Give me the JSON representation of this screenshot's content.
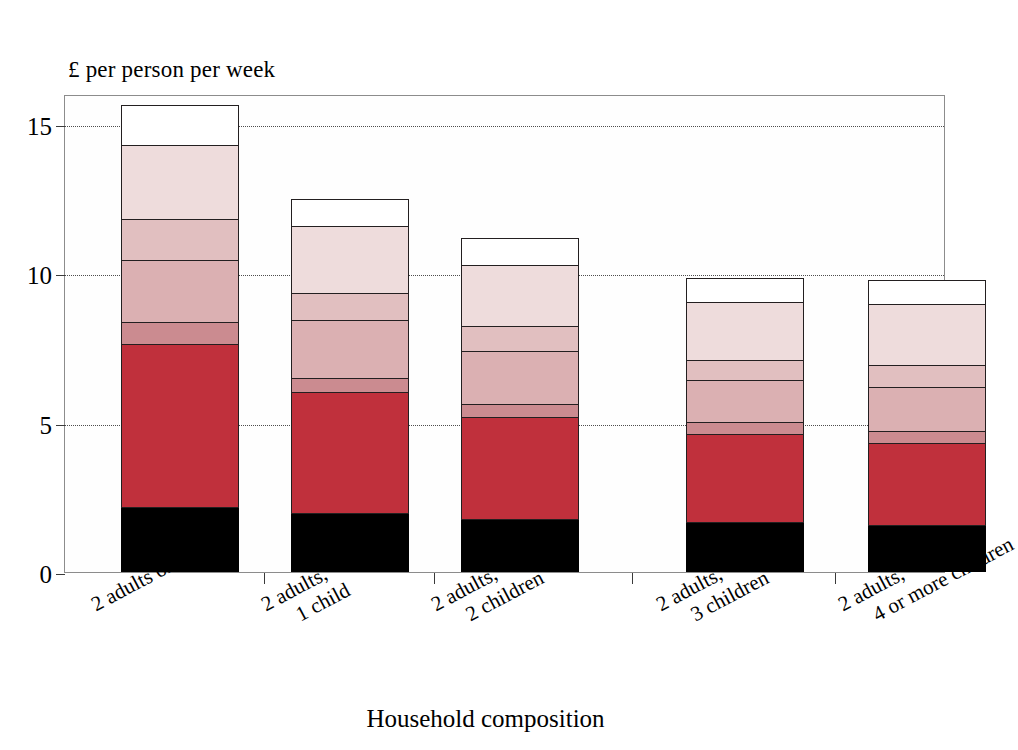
{
  "chart_data": {
    "type": "bar",
    "subtype": "stacked-bar",
    "title": "",
    "ylabel": "£ per person per week",
    "xlabel": "Household composition",
    "ylim": [
      0,
      16
    ],
    "yticks": [
      0,
      5,
      10,
      15
    ],
    "ytick_labels": [
      "0",
      "5",
      "10",
      "15"
    ],
    "grid": "horizontal-dotted",
    "legend": "none",
    "categories": [
      "2 adults only",
      "2 adults, 1 child",
      "2 adults, 2 children",
      "2 adults, 3 children",
      "2 adults, 4 or more children"
    ],
    "category_lines": [
      [
        "2 adults only",
        ""
      ],
      [
        "2 adults,",
        "1 child"
      ],
      [
        "2 adults,",
        "2 children"
      ],
      [
        "2 adults,",
        "3 children"
      ],
      [
        "2 adults,",
        "4 or more children"
      ]
    ],
    "series": [
      {
        "name": "segment-1",
        "color": "#000000",
        "values": [
          2.15,
          1.95,
          1.75,
          1.65,
          1.55
        ]
      },
      {
        "name": "segment-2",
        "color": "#c0303c",
        "values": [
          5.45,
          4.05,
          3.4,
          2.95,
          2.75
        ]
      },
      {
        "name": "segment-3",
        "color": "#cb8b90",
        "values": [
          0.75,
          0.45,
          0.45,
          0.4,
          0.4
        ]
      },
      {
        "name": "segment-4",
        "color": "#dbb0b2",
        "values": [
          2.05,
          1.95,
          1.75,
          1.4,
          1.45
        ]
      },
      {
        "name": "segment-5",
        "color": "#e1bfc0",
        "values": [
          1.4,
          0.9,
          0.85,
          0.65,
          0.75
        ]
      },
      {
        "name": "segment-6",
        "color": "#eedcdc",
        "values": [
          2.45,
          2.25,
          2.05,
          1.95,
          2.05
        ]
      },
      {
        "name": "segment-7",
        "color": "#ffffff",
        "values": [
          1.35,
          0.9,
          0.9,
          0.8,
          0.8
        ]
      }
    ],
    "totals": [
      15.6,
      12.45,
      11.15,
      9.8,
      9.75
    ],
    "bar_geometry": {
      "plot_left_px": 64,
      "plot_top_px": 95,
      "plot_width_px": 881,
      "plot_height_px": 478,
      "baseline_y_px": 478,
      "px_per_unit": 29.87,
      "bar_width_px": 118,
      "bar_centers_px": [
        115,
        285,
        455,
        680,
        862
      ]
    }
  }
}
